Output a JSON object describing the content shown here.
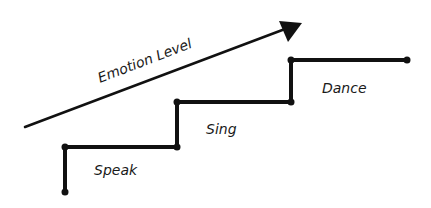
{
  "diagram": {
    "arrow_label": "Emotion Level",
    "steps": [
      {
        "label": "Speak"
      },
      {
        "label": "Sing"
      },
      {
        "label": "Dance"
      }
    ],
    "colors": {
      "ink": "#111111",
      "background": "#ffffff"
    }
  }
}
